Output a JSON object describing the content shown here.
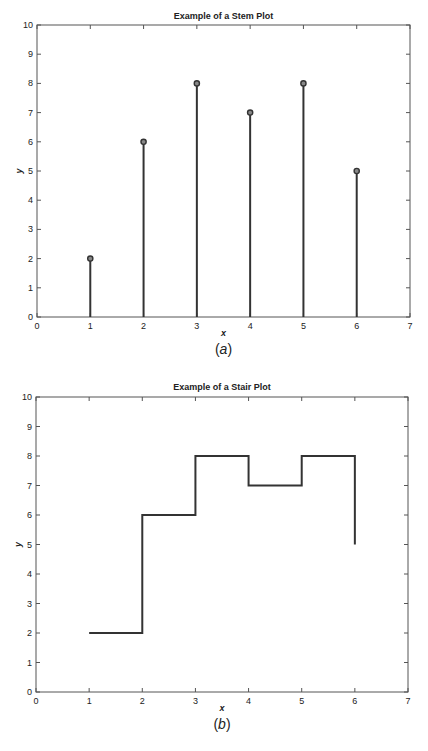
{
  "chart_data": [
    {
      "type": "stem",
      "title": "Example of a Stem Plot",
      "xlabel": "x",
      "ylabel": "y",
      "caption_letter": "a",
      "x": [
        1,
        2,
        3,
        4,
        5,
        6
      ],
      "values": [
        2,
        6,
        8,
        7,
        8,
        5
      ],
      "xlim": [
        0,
        7
      ],
      "ylim": [
        0,
        10
      ],
      "xticks": [
        0,
        1,
        2,
        3,
        4,
        5,
        6,
        7
      ],
      "yticks": [
        0,
        1,
        2,
        3,
        4,
        5,
        6,
        7,
        8,
        9,
        10
      ],
      "grid": false,
      "marker": "circle"
    },
    {
      "type": "stairs",
      "title": "Example of a Stair Plot",
      "xlabel": "x",
      "ylabel": "y",
      "caption_letter": "b",
      "x": [
        1,
        2,
        3,
        4,
        5,
        6
      ],
      "values": [
        2,
        6,
        8,
        7,
        8,
        5
      ],
      "xlim": [
        0,
        7
      ],
      "ylim": [
        0,
        10
      ],
      "xticks": [
        0,
        1,
        2,
        3,
        4,
        5,
        6,
        7
      ],
      "yticks": [
        0,
        1,
        2,
        3,
        4,
        5,
        6,
        7,
        8,
        9,
        10
      ],
      "grid": false
    }
  ],
  "style": {
    "line_color": "#333333",
    "axis_color": "#555555"
  }
}
